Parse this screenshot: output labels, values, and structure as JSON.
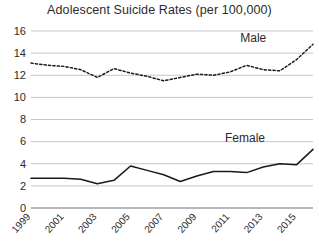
{
  "chart_data": {
    "type": "line",
    "title": "Adolescent Suicide Rates (per 100,000)",
    "xlabel": "",
    "ylabel": "",
    "ylim": [
      0,
      16
    ],
    "xlim": [
      1999,
      2016
    ],
    "grid": true,
    "legend_position": "inline-annotation",
    "yticks": [
      0,
      2,
      4,
      6,
      8,
      10,
      12,
      14,
      16
    ],
    "ytick_labels": [
      "0",
      "2",
      "4",
      "6",
      "8",
      "10",
      "12",
      "14",
      "16"
    ],
    "xticks": [
      1999,
      2001,
      2003,
      2005,
      2007,
      2009,
      2011,
      2013,
      2015
    ],
    "xtick_labels": [
      "1999",
      "2001",
      "2003",
      "2005",
      "2007",
      "2009",
      "2011",
      "2013",
      "2015"
    ],
    "x": [
      1999,
      2000,
      2001,
      2002,
      2003,
      2004,
      2005,
      2006,
      2007,
      2008,
      2009,
      2010,
      2011,
      2012,
      2013,
      2014,
      2015,
      2016
    ],
    "series": [
      {
        "name": "Male",
        "style": "dashed",
        "color": "#1a1a1a",
        "values": [
          13.1,
          12.9,
          12.8,
          12.5,
          11.8,
          12.6,
          12.2,
          11.9,
          11.5,
          11.8,
          12.1,
          12.0,
          12.3,
          12.9,
          12.5,
          12.4,
          13.4,
          14.8
        ],
        "label_position": {
          "x": 2012.4,
          "y": 15.0
        }
      },
      {
        "name": "Female",
        "style": "solid",
        "color": "#1a1a1a",
        "values": [
          2.7,
          2.7,
          2.7,
          2.6,
          2.2,
          2.5,
          3.8,
          3.4,
          3.0,
          2.4,
          2.9,
          3.3,
          3.3,
          3.2,
          3.7,
          4.0,
          3.9,
          5.3
        ],
        "label_position": {
          "x": 2011.9,
          "y": 6.0
        }
      }
    ]
  }
}
